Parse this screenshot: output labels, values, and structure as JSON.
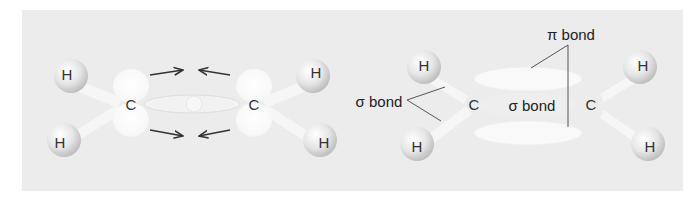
{
  "figure": {
    "background": "#ececec",
    "left_panel": {
      "description": "Two sp2 carbons approaching; p orbitals and sigma overlap",
      "atoms": [
        {
          "symbol": "H",
          "x": 67,
          "y": 74
        },
        {
          "symbol": "H",
          "x": 60,
          "y": 140
        },
        {
          "symbol": "C",
          "x": 131,
          "y": 103
        },
        {
          "symbol": "C",
          "x": 254,
          "y": 103
        },
        {
          "symbol": "H",
          "x": 315,
          "y": 74
        },
        {
          "symbol": "H",
          "x": 323,
          "y": 140
        }
      ],
      "arrows": [
        {
          "direction": "right",
          "position": "upper-left"
        },
        {
          "direction": "left",
          "position": "upper-right"
        },
        {
          "direction": "right",
          "position": "lower-left"
        },
        {
          "direction": "left",
          "position": "lower-right"
        }
      ]
    },
    "right_panel": {
      "description": "Ethylene double bond: sigma and pi bonds",
      "atoms": [
        {
          "symbol": "H",
          "x": 424,
          "y": 64
        },
        {
          "symbol": "H",
          "x": 417,
          "y": 145
        },
        {
          "symbol": "C",
          "x": 474,
          "y": 104
        },
        {
          "symbol": "C",
          "x": 591,
          "y": 104
        },
        {
          "symbol": "H",
          "x": 643,
          "y": 64
        },
        {
          "symbol": "H",
          "x": 650,
          "y": 145
        }
      ],
      "labels": {
        "pi_bond": "π bond",
        "sigma_bond_ch": "σ bond",
        "sigma_bond_cc": "σ bond"
      }
    }
  }
}
